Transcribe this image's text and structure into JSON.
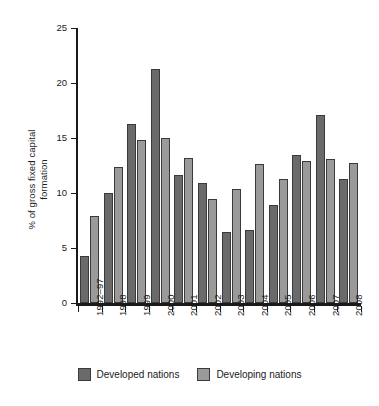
{
  "chart_data": {
    "type": "bar",
    "title": "",
    "subtitle": "",
    "xlabel": "",
    "ylabel": "% of gross fixed capital formation",
    "ylabel_lines": [
      "% of gross fixed capital",
      "formation"
    ],
    "ylim": [
      0,
      25
    ],
    "yticks": [
      0,
      5,
      10,
      15,
      20,
      25
    ],
    "ytick_labels": [
      "0",
      "5",
      "10",
      "15",
      "20",
      "25"
    ],
    "grid": false,
    "legend_position": "bottom",
    "categories": [
      "1992–97",
      "1998",
      "1999",
      "2000",
      "2001",
      "2002",
      "2003",
      "2004",
      "2005",
      "2006",
      "2007",
      "2008"
    ],
    "series": [
      {
        "name": "Developed nations",
        "color": "#6a6a6a",
        "values": [
          4.3,
          10.0,
          16.3,
          21.3,
          11.6,
          10.9,
          6.5,
          6.6,
          8.9,
          13.5,
          17.1,
          11.3
        ]
      },
      {
        "name": "Developing nations",
        "color": "#9a9a9a",
        "values": [
          7.9,
          12.4,
          14.8,
          15.0,
          13.2,
          9.5,
          10.4,
          12.6,
          11.3,
          12.9,
          13.1,
          12.7
        ]
      }
    ]
  },
  "legend": {
    "entries": [
      {
        "label": "Developed nations",
        "swatch": "developed"
      },
      {
        "label": "Developing nations",
        "swatch": "developing"
      }
    ]
  },
  "colors": {
    "developed": "#6a6a6a",
    "developing": "#9a9a9a",
    "axis": "#1a1a1a",
    "background": "#ffffff"
  }
}
